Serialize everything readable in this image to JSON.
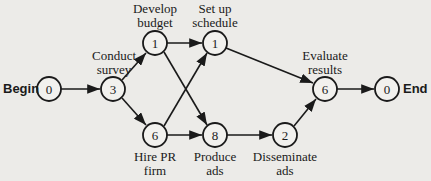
{
  "diagram": {
    "terminals": {
      "begin": "Begin",
      "end": "End"
    },
    "nodes": [
      {
        "id": "begin",
        "duration": "0",
        "label": ""
      },
      {
        "id": "survey",
        "duration": "3",
        "label": "Conduct\nsurvey"
      },
      {
        "id": "budget",
        "duration": "1",
        "label": "Develop\nbudget"
      },
      {
        "id": "pr",
        "duration": "6",
        "label": "Hire PR\nfirm"
      },
      {
        "id": "schedule",
        "duration": "1",
        "label": "Set up\nschedule"
      },
      {
        "id": "produce",
        "duration": "8",
        "label": "Produce\nads"
      },
      {
        "id": "disseminate",
        "duration": "2",
        "label": "Disseminate\nads"
      },
      {
        "id": "evaluate",
        "duration": "6",
        "label": "Evaluate\nresults"
      },
      {
        "id": "end",
        "duration": "0",
        "label": ""
      }
    ],
    "edges": [
      [
        "begin",
        "survey"
      ],
      [
        "survey",
        "budget"
      ],
      [
        "survey",
        "pr"
      ],
      [
        "budget",
        "schedule"
      ],
      [
        "budget",
        "produce"
      ],
      [
        "pr",
        "schedule"
      ],
      [
        "pr",
        "produce"
      ],
      [
        "schedule",
        "evaluate"
      ],
      [
        "produce",
        "disseminate"
      ],
      [
        "disseminate",
        "evaluate"
      ],
      [
        "evaluate",
        "end"
      ]
    ]
  }
}
